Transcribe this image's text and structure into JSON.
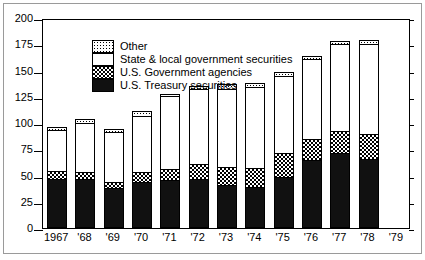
{
  "chart_data": {
    "type": "bar",
    "stacked": true,
    "title": "",
    "subtitle": "",
    "xlabel": "",
    "ylabel": "",
    "ylim": [
      0,
      200
    ],
    "ytick_values": [
      0,
      25,
      50,
      75,
      100,
      125,
      150,
      175,
      200
    ],
    "ytick_labels": [
      "0",
      "25",
      "50",
      "75",
      "100",
      "125",
      "150",
      "175",
      "200"
    ],
    "grid": false,
    "legend_position": "top-left",
    "categories": [
      "1967",
      "'68",
      "'69",
      "'70",
      "'71",
      "'72",
      "'73",
      "'74",
      "'75",
      "'76",
      "'77",
      "'78",
      "'79"
    ],
    "series": [
      {
        "name": "U.S. Treasury securities",
        "pattern": "solid-black",
        "values": [
          47,
          47,
          38,
          44,
          46,
          47,
          41,
          39,
          49,
          65,
          71,
          66,
          null
        ]
      },
      {
        "name": "U.S. Government agencies",
        "pattern": "checkerboard",
        "values": [
          7,
          6,
          6,
          9,
          10,
          14,
          17,
          18,
          22,
          20,
          21,
          24,
          null
        ]
      },
      {
        "name": "State & local government securities",
        "pattern": "white",
        "values": [
          39,
          47,
          47,
          54,
          70,
          71,
          74,
          77,
          74,
          76,
          83,
          85,
          null
        ]
      },
      {
        "name": "Other",
        "pattern": "dotted",
        "values": [
          3,
          4,
          3,
          4,
          2,
          3,
          5,
          4,
          4,
          3,
          3,
          4,
          null
        ]
      }
    ],
    "totals": [
      96,
      104,
      94,
      111,
      128,
      135,
      137,
      138,
      149,
      164,
      178,
      179,
      null
    ],
    "annotations": []
  },
  "legend": {
    "items": [
      {
        "label": "Other",
        "pattern": "dotted"
      },
      {
        "label": "State & local government securities",
        "pattern": "white"
      },
      {
        "label": "U.S. Government agencies",
        "pattern": "checkerboard"
      },
      {
        "label": "U.S. Treasury securities",
        "pattern": "solid-black"
      }
    ]
  },
  "colors": {
    "axis": "#000000",
    "frame": "#9a9a9a",
    "background": "#ffffff",
    "treasury": "#111111",
    "agencies": "#808080",
    "state_local": "#ffffff",
    "other": "#ffffff"
  }
}
